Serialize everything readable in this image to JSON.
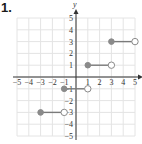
{
  "problem_number": "1.",
  "chart_data": {
    "type": "line",
    "subtype": "step-function",
    "title": "",
    "xlabel": "",
    "ylabel": "y",
    "xlim": [
      -5,
      5
    ],
    "ylim": [
      -5,
      5
    ],
    "grid": true,
    "x_ticks": [
      -5,
      -4,
      -3,
      -2,
      -1,
      1,
      2,
      3,
      4,
      5
    ],
    "y_ticks": [
      5,
      4,
      3,
      2,
      1,
      -1,
      -2,
      -3,
      -4,
      -5
    ],
    "segments": [
      {
        "y": -3,
        "x_start": -3,
        "x_end": -1,
        "start_closed": true,
        "end_closed": false
      },
      {
        "y": -1,
        "x_start": -1,
        "x_end": 1,
        "start_closed": true,
        "end_closed": false
      },
      {
        "y": 1,
        "x_start": 1,
        "x_end": 3,
        "start_closed": true,
        "end_closed": false
      },
      {
        "y": 3,
        "x_start": 3,
        "x_end": 5,
        "start_closed": true,
        "end_closed": false
      }
    ]
  },
  "colors": {
    "grid": "#e4e4e4",
    "axis": "#333333",
    "segment": "#7a7a7a",
    "closed_dot": "#8a8a8a",
    "open_dot_fill": "#ffffff",
    "open_dot_stroke": "#8a8a8a",
    "text": "#333333"
  }
}
